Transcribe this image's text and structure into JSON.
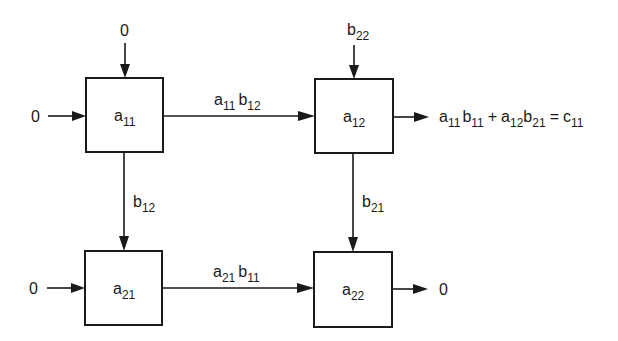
{
  "diagram": {
    "type": "systolic-array-matrix-multiply",
    "cells": [
      {
        "id": "a11",
        "base": "a",
        "sub": "11",
        "x": 86,
        "y": 78,
        "w": 77,
        "h": 74
      },
      {
        "id": "a12",
        "base": "a",
        "sub": "12",
        "x": 315,
        "y": 79,
        "w": 78,
        "h": 74
      },
      {
        "id": "a21",
        "base": "a",
        "sub": "21",
        "x": 85,
        "y": 251,
        "w": 77,
        "h": 74
      },
      {
        "id": "a22",
        "base": "a",
        "sub": "22",
        "x": 314,
        "y": 252,
        "w": 78,
        "h": 75
      }
    ],
    "inputs": {
      "a11_top": "0",
      "a11_left": "0",
      "a12_top": {
        "base": "b",
        "sub": "22"
      },
      "a21_left": "0"
    },
    "edges": {
      "a11_to_a12": [
        {
          "base": "a",
          "sub": "11"
        },
        {
          "base": "b",
          "sub": "12"
        }
      ],
      "a11_to_a21": [
        {
          "base": "b",
          "sub": "12"
        }
      ],
      "a12_to_a22": [
        {
          "base": "b",
          "sub": "21"
        }
      ],
      "a21_to_a22": [
        {
          "base": "a",
          "sub": "21"
        },
        {
          "base": "b",
          "sub": "11"
        }
      ]
    },
    "outputs": {
      "a12_right": {
        "terms": [
          [
            {
              "base": "a",
              "sub": "11"
            },
            {
              "base": "b",
              "sub": "11"
            }
          ],
          [
            {
              "base": "a",
              "sub": "12"
            },
            {
              "base": "b",
              "sub": "21"
            }
          ]
        ],
        "plus": "+",
        "equals": "=",
        "result": {
          "base": "c",
          "sub": "11"
        }
      },
      "a22_right": "0"
    },
    "colors": {
      "ink": "#1a1a1a",
      "background": "#ffffff"
    }
  }
}
